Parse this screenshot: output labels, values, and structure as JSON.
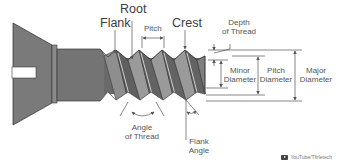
{
  "diagram": {
    "colors": {
      "metal_dark": "#6e6e6e",
      "metal_mid": "#8c8c8c",
      "metal_light": "#a6a6a6",
      "outline": "#3a3a3a",
      "dimension_line": "#555555",
      "text": "#3c3c3c",
      "background": "#ffffff"
    },
    "labels": {
      "flank": "Flank",
      "root": "Root",
      "pitch": "Pitch",
      "crest": "Crest",
      "depth_of_thread_line1": "Depth",
      "depth_of_thread_line2": "of Thread",
      "minor_diameter_line1": "Minor",
      "minor_diameter_line2": "Diameter",
      "pitch_diameter_line1": "Pitch",
      "pitch_diameter_line2": "Diameter",
      "major_diameter_line1": "Major",
      "major_diameter_line2": "Diameter",
      "angle_of_thread_line1": "Angle",
      "angle_of_thread_line2": "of Thread",
      "flank_angle_line1": "Flank",
      "flank_angle_line2": "Angle"
    },
    "watermark": {
      "icon": "youtube-icon",
      "text": "YouTube/Tfirletech"
    }
  }
}
